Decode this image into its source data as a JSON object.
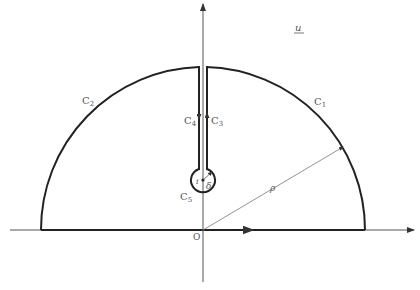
{
  "diagram": {
    "plane_label": "u",
    "origin_label": "O",
    "curves": [
      {
        "id": "C1",
        "base": "C",
        "sub": "1",
        "desc": "outer arc right"
      },
      {
        "id": "C2",
        "base": "C",
        "sub": "2",
        "desc": "outer arc left"
      },
      {
        "id": "C3",
        "base": "C",
        "sub": "3",
        "desc": "slit right side (upward)"
      },
      {
        "id": "C4",
        "base": "C",
        "sub": "4",
        "desc": "slit left side (downward)"
      },
      {
        "id": "C5",
        "base": "C",
        "sub": "5",
        "desc": "small circle around i"
      }
    ],
    "point_label": "i",
    "small_radius_label": "δ",
    "large_radius_label": "ρ",
    "colors": {
      "stroke": "#222222",
      "thin": "#555555",
      "text": "#555555"
    }
  }
}
